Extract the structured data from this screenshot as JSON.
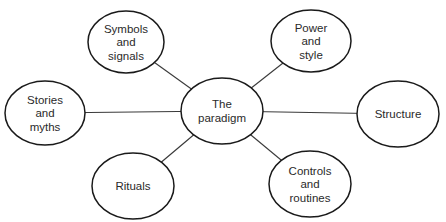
{
  "diagram": {
    "center": {
      "id": "paradigm",
      "lines": [
        "The",
        "paradigm"
      ],
      "cx": 222,
      "cy": 111,
      "rx": 41,
      "ry": 33
    },
    "nodes": [
      {
        "id": "symbols",
        "lines": [
          "Symbols",
          "and",
          "signals"
        ],
        "cx": 126,
        "cy": 42,
        "rx": 38,
        "ry": 31
      },
      {
        "id": "power",
        "lines": [
          "Power",
          "and",
          "style"
        ],
        "cx": 311,
        "cy": 41,
        "rx": 40,
        "ry": 31
      },
      {
        "id": "stories",
        "lines": [
          "Stories",
          "and",
          "myths"
        ],
        "cx": 45,
        "cy": 113,
        "rx": 40,
        "ry": 32
      },
      {
        "id": "structure",
        "lines": [
          "Structure"
        ],
        "cx": 398,
        "cy": 114,
        "rx": 41,
        "ry": 33
      },
      {
        "id": "rituals",
        "lines": [
          "Rituals"
        ],
        "cx": 133,
        "cy": 186,
        "rx": 41,
        "ry": 33
      },
      {
        "id": "controls",
        "lines": [
          "Controls",
          "and",
          "routines"
        ],
        "cx": 310,
        "cy": 184,
        "rx": 41,
        "ry": 33
      }
    ],
    "edges": [
      {
        "from": "paradigm",
        "to": "symbols"
      },
      {
        "from": "paradigm",
        "to": "power"
      },
      {
        "from": "paradigm",
        "to": "stories"
      },
      {
        "from": "paradigm",
        "to": "structure"
      },
      {
        "from": "paradigm",
        "to": "rituals"
      },
      {
        "from": "paradigm",
        "to": "controls"
      }
    ],
    "colors": {
      "stroke": "#1a1a1a",
      "edge": "#3a3a3a",
      "text": "#2a2a2a",
      "background": "#ffffff"
    }
  }
}
